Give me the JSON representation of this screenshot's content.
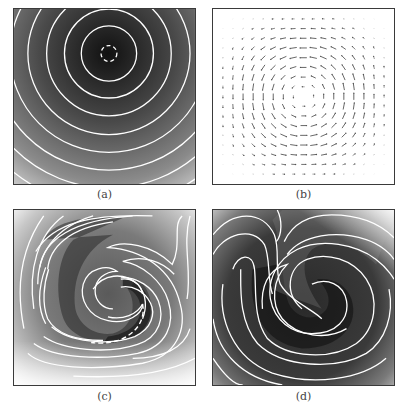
{
  "figure": {
    "panels": [
      {
        "id": "a",
        "label": "(a)",
        "content": "grayscale contour plot of concentric circular contours centered near top-middle, darker at center, lighter towards bottom-left/bottom-right; innermost contour dashed"
      },
      {
        "id": "b",
        "label": "(b)",
        "content": "vector field (quiver plot) showing counter-clockwise rotating vortex flow in a square domain"
      },
      {
        "id": "c",
        "label": "(c)",
        "content": "grayscale contour plot of spiral-stretched field after advection, S-shaped core with dashed contour segment at lower right"
      },
      {
        "id": "d",
        "label": "(d)",
        "content": "grayscale contour plot of strongly wound double spiral field, darker interior"
      }
    ],
    "colors": {
      "contour_line": "#ffffff",
      "dark_field": "#1e1e1e",
      "light_field": "#f2f2f2",
      "frame": "#3a3a3a",
      "arrow": "#555555"
    }
  }
}
